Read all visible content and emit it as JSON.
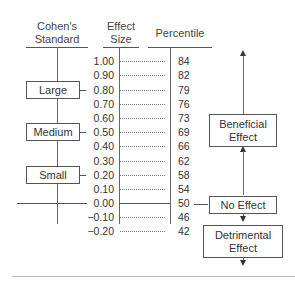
{
  "headers": {
    "cohens": "Cohen's Standard",
    "cohens_line1": "Cohen's",
    "cohens_line2": "Standard",
    "effect_line1": "Effect",
    "effect_line2": "Size",
    "percentile": "Percentile"
  },
  "rows": [
    {
      "effect_size": "1.00",
      "percentile": "84"
    },
    {
      "effect_size": "0.90",
      "percentile": "82"
    },
    {
      "effect_size": "0.80",
      "percentile": "79"
    },
    {
      "effect_size": "0.70",
      "percentile": "76"
    },
    {
      "effect_size": "0.60",
      "percentile": "73"
    },
    {
      "effect_size": "0.50",
      "percentile": "69"
    },
    {
      "effect_size": "0.40",
      "percentile": "66"
    },
    {
      "effect_size": "0.30",
      "percentile": "62"
    },
    {
      "effect_size": "0.20",
      "percentile": "58"
    },
    {
      "effect_size": "0.10",
      "percentile": "54"
    },
    {
      "effect_size": "0.00",
      "percentile": "50"
    },
    {
      "effect_size": "−0.10",
      "percentile": "46"
    },
    {
      "effect_size": "−0.20",
      "percentile": "42"
    }
  ],
  "cohen_labels": {
    "large": "Large",
    "medium": "Medium",
    "small": "Small"
  },
  "effect_labels": {
    "beneficial_line1": "Beneficial",
    "beneficial_line2": "Effect",
    "no_effect": "No Effect",
    "detrimental_line1": "Detrimental",
    "detrimental_line2": "Effect"
  }
}
